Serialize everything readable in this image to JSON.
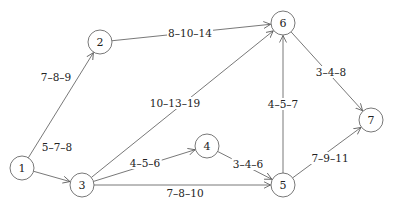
{
  "diagram": {
    "type": "network",
    "nodes": [
      {
        "id": "1",
        "label": "1",
        "x": 22,
        "y": 168
      },
      {
        "id": "2",
        "label": "2",
        "x": 100,
        "y": 42
      },
      {
        "id": "3",
        "label": "3",
        "x": 82,
        "y": 185
      },
      {
        "id": "4",
        "label": "4",
        "x": 207,
        "y": 146
      },
      {
        "id": "5",
        "label": "5",
        "x": 283,
        "y": 185
      },
      {
        "id": "6",
        "label": "6",
        "x": 283,
        "y": 23
      },
      {
        "id": "7",
        "label": "7",
        "x": 371,
        "y": 120
      }
    ],
    "edges": [
      {
        "from": "1",
        "to": "2",
        "label": "7–8–9",
        "lx": 56,
        "ly": 77
      },
      {
        "from": "1",
        "to": "3",
        "label": "5–7–8",
        "lx": 57,
        "ly": 147
      },
      {
        "from": "2",
        "to": "6",
        "label": "8–10–14",
        "lx": 190,
        "ly": 33
      },
      {
        "from": "3",
        "to": "6",
        "label": "10–13–19",
        "lx": 175,
        "ly": 103
      },
      {
        "from": "3",
        "to": "4",
        "label": "4–5–6",
        "lx": 145,
        "ly": 163
      },
      {
        "from": "3",
        "to": "5",
        "label": "7–8–10",
        "lx": 185,
        "ly": 193
      },
      {
        "from": "4",
        "to": "5",
        "label": "3–4–6",
        "lx": 248,
        "ly": 164
      },
      {
        "from": "5",
        "to": "6",
        "label": "4–5–7",
        "lx": 283,
        "ly": 104
      },
      {
        "from": "6",
        "to": "7",
        "label": "3–4–8",
        "lx": 331,
        "ly": 72
      },
      {
        "from": "5",
        "to": "7",
        "label": "7–9–11",
        "lx": 330,
        "ly": 158
      }
    ]
  }
}
